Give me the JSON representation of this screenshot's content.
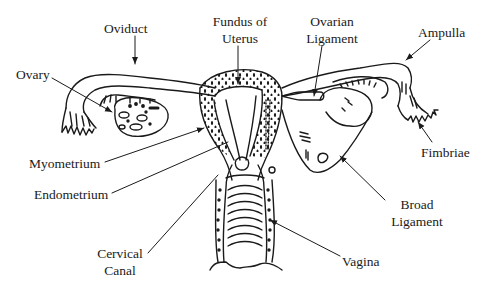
{
  "diagram": {
    "labels": {
      "oviduct": "Oviduct",
      "fundus_line1": "Fundus of",
      "fundus_line2": "Uterus",
      "ovarian_ligament_line1": "Ovarian",
      "ovarian_ligament_line2": "Ligament",
      "ampulla": "Ampulla",
      "ovary": "Ovary",
      "myometrium": "Myometrium",
      "endometrium": "Endometrium",
      "fimbriae": "Fimbriae",
      "broad_ligament_line1": "Broad",
      "broad_ligament_line2": "Ligament",
      "cervical_canal_line1": "Cervical",
      "cervical_canal_line2": "Canal",
      "vagina": "Vagina"
    },
    "colors": {
      "ink": "#1a1a1a",
      "background": "#ffffff"
    }
  }
}
